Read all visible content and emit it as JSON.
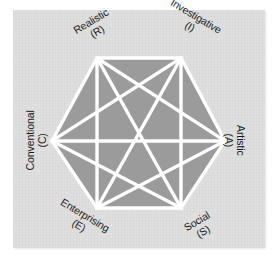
{
  "figure": {
    "panel_background": "#dedede",
    "hexagon_fill": "#9b9b9b",
    "line_color": "#ffffff",
    "text_color": "#1a1a1a"
  },
  "chart_data": {
    "type": "diagram",
    "shape": "regular-hexagon",
    "title": "",
    "vertices": [
      {
        "code": "R",
        "label": "Realistic",
        "sublabel": "(R)",
        "position": "top-left",
        "x": 97,
        "y": 58,
        "rotation": -31
      },
      {
        "code": "I",
        "label": "Investigative",
        "sublabel": "(I)",
        "position": "top-right",
        "x": 181,
        "y": 58,
        "rotation": 31
      },
      {
        "code": "A",
        "label": "Artistic",
        "sublabel": "(A)",
        "position": "right",
        "x": 225,
        "y": 141,
        "rotation": 90
      },
      {
        "code": "S",
        "label": "Social",
        "sublabel": "(S)",
        "position": "bottom-right",
        "x": 181,
        "y": 208,
        "rotation": -31
      },
      {
        "code": "E",
        "label": "Enterprising",
        "sublabel": "(E)",
        "position": "bottom-left",
        "x": 97,
        "y": 208,
        "rotation": 31
      },
      {
        "code": "C",
        "label": "Conventional",
        "sublabel": "(C)",
        "position": "left",
        "x": 52,
        "y": 141,
        "rotation": -90
      }
    ],
    "edges": [
      [
        "R",
        "I"
      ],
      [
        "I",
        "A"
      ],
      [
        "A",
        "S"
      ],
      [
        "S",
        "E"
      ],
      [
        "E",
        "C"
      ],
      [
        "C",
        "R"
      ],
      [
        "R",
        "A"
      ],
      [
        "R",
        "S"
      ],
      [
        "R",
        "E"
      ],
      [
        "I",
        "S"
      ],
      [
        "I",
        "E"
      ],
      [
        "I",
        "C"
      ],
      [
        "A",
        "E"
      ],
      [
        "A",
        "C"
      ],
      [
        "S",
        "C"
      ]
    ],
    "edge_count": 15,
    "legend": [],
    "grid": false
  }
}
